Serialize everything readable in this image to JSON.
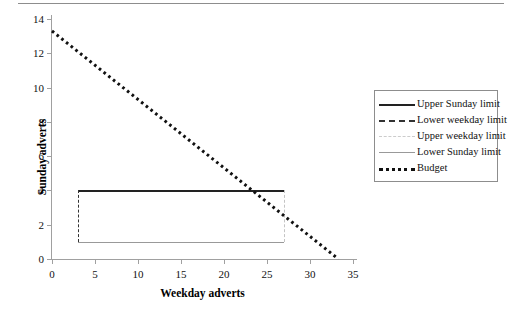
{
  "chart_data": {
    "type": "line",
    "title": "",
    "xlabel": "Weekday adverts",
    "ylabel": "Sunday adverts",
    "xlim": [
      0,
      35
    ],
    "ylim": [
      0,
      14
    ],
    "xticks": [
      0,
      5,
      10,
      15,
      20,
      25,
      30,
      35
    ],
    "yticks": [
      0,
      2,
      4,
      6,
      8,
      10,
      12,
      14
    ],
    "grid": false,
    "legend_position": "right",
    "series": [
      {
        "name": "Upper Sunday limit",
        "style": "solid",
        "color": "#222222",
        "width": 2.5,
        "orientation": "horizontal",
        "value": 4,
        "x": [
          3,
          27
        ],
        "y": [
          4,
          4
        ]
      },
      {
        "name": "Lower weekday limit",
        "style": "dashed",
        "color": "#333333",
        "width": 1.5,
        "orientation": "vertical",
        "value": 3,
        "x": [
          3,
          3
        ],
        "y": [
          1,
          4
        ]
      },
      {
        "name": "Upper weekday limit",
        "style": "dashdot",
        "color": "#c4c4c4",
        "width": 1.5,
        "orientation": "vertical",
        "value": 27,
        "x": [
          27,
          27
        ],
        "y": [
          1,
          4
        ]
      },
      {
        "name": "Lower Sunday limit",
        "style": "solid",
        "color": "#999999",
        "width": 1.5,
        "orientation": "horizontal",
        "value": 1,
        "x": [
          3,
          27
        ],
        "y": [
          1,
          1
        ]
      },
      {
        "name": "Budget",
        "style": "dotted",
        "color": "#111111",
        "width": 3,
        "orientation": "diagonal",
        "x": [
          0,
          33.3
        ],
        "y": [
          13.3,
          0
        ]
      }
    ]
  },
  "axes": {
    "y_title": "Sunday adverts",
    "x_title": "Weekday adverts",
    "y_tick_labels": [
      "0",
      "2",
      "4",
      "6",
      "8",
      "10",
      "12",
      "14"
    ],
    "x_tick_labels": [
      "0",
      "5",
      "10",
      "15",
      "20",
      "25",
      "30",
      "35"
    ]
  },
  "legend": {
    "items": [
      {
        "label": "Upper Sunday limit"
      },
      {
        "label": "Lower weekday limit"
      },
      {
        "label": "Upper weekday limit"
      },
      {
        "label": "Lower Sunday limit"
      },
      {
        "label": "Budget"
      }
    ]
  },
  "colors": {
    "axis": "#a0a0a0",
    "rule": "#8d8d8d",
    "black": "#222222",
    "gray": "#999999",
    "light_gray": "#c4c4c4"
  }
}
